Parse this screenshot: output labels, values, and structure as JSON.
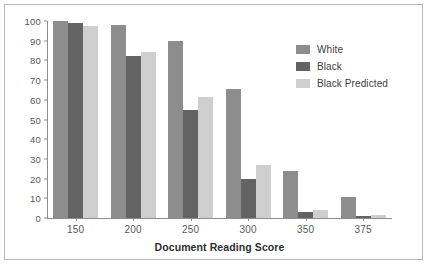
{
  "chart_data": {
    "type": "bar",
    "title": "",
    "xlabel": "Document Reading Score",
    "ylabel": "Percent Above Score",
    "categories": [
      "150",
      "200",
      "250",
      "300",
      "350",
      "375"
    ],
    "series": [
      {
        "name": "White",
        "color": "#8d8d8d",
        "values": [
          100,
          98,
          90,
          65.5,
          24,
          10.5
        ]
      },
      {
        "name": "Black",
        "color": "#636363",
        "values": [
          99,
          82,
          55,
          20,
          3,
          1
        ]
      },
      {
        "name": "Black Predicted",
        "color": "#cfcfcf",
        "values": [
          97.5,
          84.5,
          61.5,
          27,
          4,
          1.5
        ]
      }
    ],
    "ylim": [
      0,
      100
    ],
    "yticks": [
      "0",
      "10",
      "20",
      "30",
      "40",
      "50",
      "60",
      "70",
      "80",
      "90",
      "100"
    ],
    "grid": false,
    "legend_position": "top-right"
  }
}
